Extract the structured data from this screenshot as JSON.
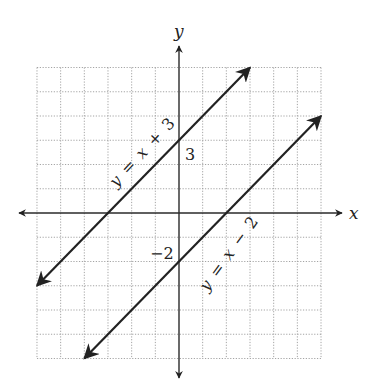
{
  "chart_data": {
    "type": "line",
    "title": "",
    "xlabel": "x",
    "ylabel": "y",
    "xlim": [
      -6,
      6
    ],
    "ylim": [
      -6,
      6
    ],
    "grid": true,
    "grid_step": 1,
    "series": [
      {
        "name": "y = x + 3",
        "equation": "y = x + 3",
        "slope": 1,
        "intercept": 3,
        "x": [
          -6,
          3
        ],
        "y": [
          -3,
          6
        ],
        "annotation": "3"
      },
      {
        "name": "y = x − 2",
        "equation": "y = x − 2",
        "slope": 1,
        "intercept": -2,
        "x": [
          -4,
          6
        ],
        "y": [
          -6,
          4
        ],
        "annotation": "−2"
      }
    ]
  },
  "labels": {
    "x_axis": "x",
    "y_axis": "y",
    "line1": {
      "y": "y",
      "eq": "=",
      "x": "x",
      "op": "+",
      "c": "3"
    },
    "line2": {
      "y": "y",
      "eq": "=",
      "x": "x",
      "op": "−",
      "c": "2"
    },
    "intercept1": "3",
    "intercept2": "−2"
  }
}
